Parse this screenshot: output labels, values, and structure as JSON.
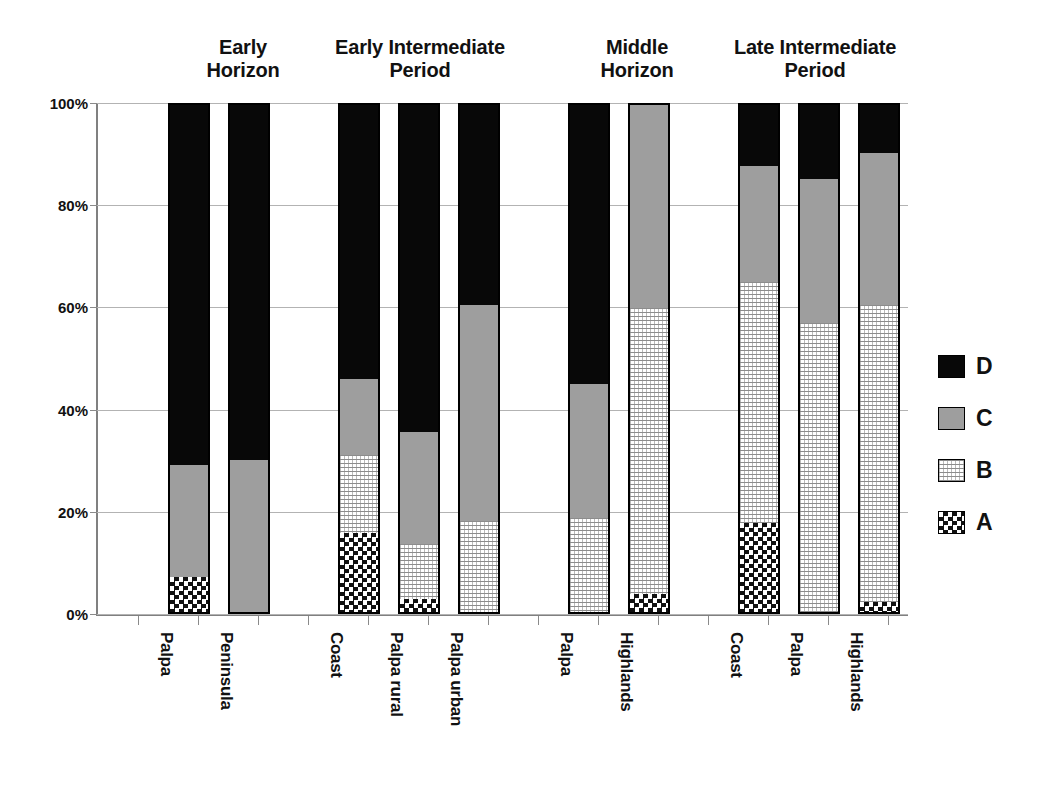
{
  "chart_data": {
    "type": "bar",
    "subtype": "stacked-percent",
    "title": "",
    "xlabel": "",
    "ylabel": "",
    "ylim": [
      0,
      100
    ],
    "ytick_labels": [
      "0%",
      "20%",
      "40%",
      "60%",
      "80%",
      "100%"
    ],
    "ytick_values": [
      0,
      20,
      40,
      60,
      80,
      100
    ],
    "grid": true,
    "legend_position": "right",
    "legend": [
      {
        "label": "D",
        "pattern": "solid-black",
        "color": "#080808"
      },
      {
        "label": "C",
        "pattern": "solid-gray",
        "color": "#9e9e9e"
      },
      {
        "label": "B",
        "pattern": "fine-grid-lines",
        "color": "#ffffff"
      },
      {
        "label": "A",
        "pattern": "checkerboard",
        "color": "#ffffff"
      }
    ],
    "series": [
      {
        "name": "A",
        "values": [
          7,
          0,
          15.5,
          2.5,
          0,
          0,
          3.5,
          17.5,
          0,
          2
        ]
      },
      {
        "name": "B",
        "values": [
          0,
          0,
          15.5,
          11,
          18,
          18.5,
          56.5,
          47.5,
          57,
          58.5
        ]
      },
      {
        "name": "C",
        "values": [
          22,
          30,
          15,
          22,
          42.5,
          26.5,
          40,
          23,
          28.5,
          30
        ]
      },
      {
        "name": "D",
        "values": [
          71,
          70,
          54,
          64.5,
          39.5,
          55,
          0,
          12,
          14.5,
          9.5
        ]
      }
    ],
    "categories": [
      "Palpa",
      "Peninsula",
      "Coast",
      "Palpa rural",
      "Palpa urban",
      "Palpa",
      "Highlands",
      "Coast",
      "Palpa",
      "Highlands"
    ],
    "groups": [
      {
        "label": "Early\nHorizon",
        "categories": [
          "Palpa",
          "Peninsula"
        ]
      },
      {
        "label": "Early Intermediate\nPeriod",
        "categories": [
          "Coast",
          "Palpa rural",
          "Palpa urban"
        ]
      },
      {
        "label": "Middle\nHorizon",
        "categories": [
          "Palpa",
          "Highlands"
        ]
      },
      {
        "label": "Late Intermediate\nPeriod",
        "categories": [
          "Coast",
          "Palpa",
          "Highlands"
        ]
      }
    ],
    "bars": [
      {
        "category": "Palpa",
        "group": "Early Horizon",
        "A": 7,
        "B": 0,
        "C": 22,
        "D": 71
      },
      {
        "category": "Peninsula",
        "group": "Early Horizon",
        "A": 0,
        "B": 0,
        "C": 30,
        "D": 70
      },
      {
        "category": "Coast",
        "group": "Early Intermediate Period",
        "A": 15.5,
        "B": 15.5,
        "C": 15,
        "D": 54
      },
      {
        "category": "Palpa rural",
        "group": "Early Intermediate Period",
        "A": 2.5,
        "B": 11,
        "C": 22,
        "D": 64.5
      },
      {
        "category": "Palpa urban",
        "group": "Early Intermediate Period",
        "A": 0,
        "B": 18,
        "C": 42.5,
        "D": 39.5
      },
      {
        "category": "Palpa",
        "group": "Middle Horizon",
        "A": 0,
        "B": 18.5,
        "C": 26.5,
        "D": 55
      },
      {
        "category": "Highlands",
        "group": "Middle Horizon",
        "A": 3.5,
        "B": 56.5,
        "C": 40,
        "D": 0
      },
      {
        "category": "Coast",
        "group": "Late Intermediate Period",
        "A": 17.5,
        "B": 47.5,
        "C": 23,
        "D": 12
      },
      {
        "category": "Palpa",
        "group": "Late Intermediate Period",
        "A": 0,
        "B": 57,
        "C": 28.5,
        "D": 14.5
      },
      {
        "category": "Highlands",
        "group": "Late Intermediate Period",
        "A": 2,
        "B": 58.5,
        "C": 30,
        "D": 9.5
      }
    ]
  },
  "layout": {
    "bar_x": [
      168,
      228,
      338,
      398,
      458,
      568,
      628,
      738,
      798,
      858
    ],
    "bar_width": 42,
    "group_title_x": [
      148,
      298,
      558,
      698
    ],
    "group_title_w": [
      190,
      250,
      160,
      250
    ],
    "tick_x": [
      138,
      198,
      258,
      308,
      368,
      428,
      488,
      538,
      598,
      658,
      708,
      768,
      828,
      888
    ],
    "label_x": [
      176,
      236,
      346,
      406,
      466,
      576,
      636,
      746,
      806,
      866
    ]
  }
}
